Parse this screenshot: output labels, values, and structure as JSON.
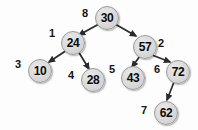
{
  "diagram": {
    "background_color": "#fdfdfd",
    "node_fill_color": "#dcdcdc",
    "node_border_color": "#9a9a9a",
    "edge_color": "#2b2b2b",
    "text_color": "#0b0b0b",
    "nodes": [
      {
        "id": "n30",
        "value": "30",
        "order_label": "8",
        "x": 95,
        "y": 6,
        "d": 24,
        "font_size": 12,
        "label_x": 82,
        "label_y": 8,
        "label_font_size": 11
      },
      {
        "id": "n24",
        "value": "24",
        "order_label": "1",
        "x": 61,
        "y": 31,
        "d": 24,
        "font_size": 12,
        "label_x": 49,
        "label_y": 28,
        "label_font_size": 11
      },
      {
        "id": "n57",
        "value": "57",
        "order_label": "2",
        "x": 133,
        "y": 35,
        "d": 24,
        "font_size": 12,
        "label_x": 158,
        "label_y": 38,
        "label_font_size": 11
      },
      {
        "id": "n10",
        "value": "10",
        "order_label": "3",
        "x": 28,
        "y": 59,
        "d": 24,
        "font_size": 12,
        "label_x": 15,
        "label_y": 59,
        "label_font_size": 11
      },
      {
        "id": "n28",
        "value": "28",
        "order_label": "4",
        "x": 81,
        "y": 68,
        "d": 24,
        "font_size": 12,
        "label_x": 68,
        "label_y": 70,
        "label_font_size": 11
      },
      {
        "id": "n43",
        "value": "43",
        "order_label": "5",
        "x": 121,
        "y": 66,
        "d": 24,
        "font_size": 12,
        "label_x": 109,
        "label_y": 64,
        "label_font_size": 11
      },
      {
        "id": "n72",
        "value": "72",
        "order_label": "6",
        "x": 166,
        "y": 60,
        "d": 24,
        "font_size": 12,
        "label_x": 154,
        "label_y": 64,
        "label_font_size": 11
      },
      {
        "id": "n62",
        "value": "62",
        "order_label": "7",
        "x": 154,
        "y": 101,
        "d": 24,
        "font_size": 12,
        "label_x": 141,
        "label_y": 105,
        "label_font_size": 11
      }
    ],
    "edges": [
      {
        "from": "n30",
        "to": "n24",
        "x1": 99,
        "y1": 24,
        "x2": 79,
        "y2": 35
      },
      {
        "from": "n30",
        "to": "n57",
        "x1": 115,
        "y1": 24,
        "x2": 136,
        "y2": 36
      },
      {
        "from": "n24",
        "to": "n10",
        "x1": 67,
        "y1": 50,
        "x2": 49,
        "y2": 62
      },
      {
        "from": "n24",
        "to": "n28",
        "x1": 78,
        "y1": 51,
        "x2": 89,
        "y2": 69
      },
      {
        "from": "n57",
        "to": "n43",
        "x1": 140,
        "y1": 56,
        "x2": 132,
        "y2": 67
      },
      {
        "from": "n57",
        "to": "n72",
        "x1": 152,
        "y1": 55,
        "x2": 170,
        "y2": 62
      },
      {
        "from": "n72",
        "to": "n62",
        "x1": 174,
        "y1": 82,
        "x2": 167,
        "y2": 100
      }
    ]
  }
}
